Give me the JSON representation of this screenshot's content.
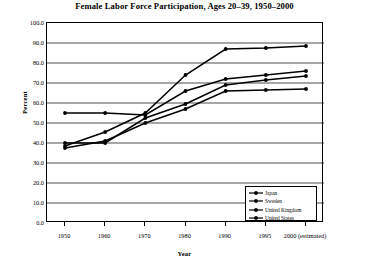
{
  "chart_data": {
    "type": "line",
    "title": "Female Labor Force Participation, Ages 20–39, 1950–2000",
    "xlabel": "Year",
    "ylabel": "Percent",
    "grid": true,
    "legend_position": "bottom-right",
    "ylim": [
      0.0,
      100.0
    ],
    "ytick_labels": [
      "100.0",
      "90.0",
      "80.0",
      "70.0",
      "60.0",
      "50.0",
      "40.0",
      "30.0",
      "20.0",
      "10.0",
      "0.0"
    ],
    "ytick_values": [
      100.0,
      90.0,
      80.0,
      70.0,
      60.0,
      50.0,
      40.0,
      30.0,
      20.0,
      10.0,
      0.0
    ],
    "categories": [
      "1950",
      "1960",
      "1970",
      "1980",
      "1990",
      "1995",
      "2000 (estimated)"
    ],
    "x_positions": [
      0,
      1,
      2,
      3,
      4,
      5,
      6
    ],
    "series": [
      {
        "name": "Japan",
        "marker": "circle",
        "color": "#000000",
        "values": [
          37.5,
          41.0,
          50.0,
          57.0,
          66.0,
          66.5,
          67.0
        ]
      },
      {
        "name": "Sweden",
        "marker": "circle",
        "color": "#000000",
        "values": [
          38.5,
          45.5,
          55.0,
          74.0,
          87.0,
          87.5,
          88.5
        ]
      },
      {
        "name": "United Kingdom",
        "marker": "circle",
        "color": "#000000",
        "values": [
          40.0,
          40.0,
          52.5,
          59.5,
          69.0,
          71.5,
          73.5
        ]
      },
      {
        "name": "United States",
        "marker": "circle",
        "color": "#000000",
        "values": [
          55.0,
          55.0,
          54.0,
          66.0,
          72.0,
          74.0,
          76.0
        ]
      }
    ]
  }
}
